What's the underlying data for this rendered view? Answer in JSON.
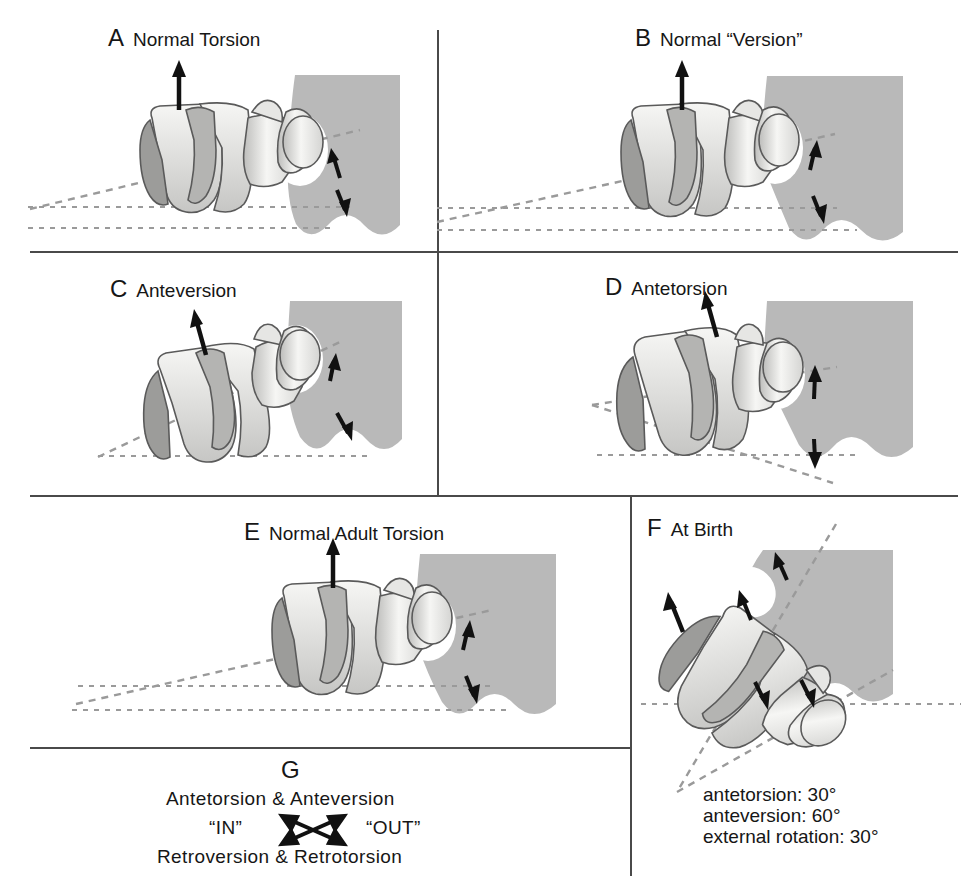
{
  "figure": {
    "domain": "anatomy-diagram",
    "colors": {
      "pelvis_gray": "#b9b9b9",
      "bone_light": "#f2f2f0",
      "bone_mid": "#cfcfcd",
      "bone_dark": "#8e8e8c",
      "outline": "#5a5a5a",
      "dashed_gray": "#9a9a9a",
      "divider": "#4a4a4a",
      "text": "#161616"
    }
  },
  "panels": [
    {
      "id": "A",
      "letter": "A",
      "title": "Normal Torsion",
      "angle": "12°",
      "arrow_direction": "up-vertical"
    },
    {
      "id": "B",
      "letter": "B",
      "title": "Normal “Version”",
      "angle": "12°",
      "arrow_direction": "up-vertical"
    },
    {
      "id": "C",
      "letter": "C",
      "title": "Anteversion",
      "angle": "25°",
      "arrow_direction": "up-tilted"
    },
    {
      "id": "D",
      "letter": "D",
      "title": "Antetorsion",
      "angle": "30°",
      "arrow_direction": "up-tilted"
    },
    {
      "id": "E",
      "letter": "E",
      "title": "Normal Adult Torsion",
      "angle": "12°",
      "arrow_direction": "up-vertical"
    },
    {
      "id": "F",
      "letter": "F",
      "title": "At Birth",
      "angle_inner": "30°",
      "angle_outer": "60°",
      "arrow_direction": "up-tilted",
      "caption_lines": [
        "antetorsion: 30°",
        "anteversion: 60°",
        "external rotation: 30°"
      ]
    },
    {
      "id": "G",
      "letter": "G",
      "line1": "Antetorsion  &  Anteversion",
      "line_left": "“IN”",
      "line_right": "“OUT”",
      "line3": "Retroversion  &  Retrotorsion"
    }
  ]
}
